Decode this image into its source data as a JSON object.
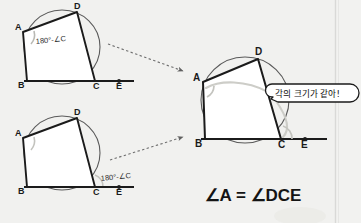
{
  "canvas": {
    "width": 361,
    "height": 223,
    "background": "#f2f2f0",
    "divider_color": "#d8d8d6"
  },
  "colors": {
    "ink": "#1a1a1a",
    "circle": "#555555",
    "quad_fill": "#ffffff",
    "arrow": "#6f6f6f",
    "highlight_arc": "#c9c9c4",
    "bubble_fill": "#ffffff",
    "bubble_stroke": "#1a1a1a",
    "shade": "#cfcfcb"
  },
  "diagrams": [
    {
      "id": "top-left",
      "name": "cyclic-quadrilateral-top-left",
      "vertices": [
        {
          "label": "A",
          "x": 23,
          "y": 32
        },
        {
          "label": "B",
          "x": 27,
          "y": 81
        },
        {
          "label": "C",
          "x": 95,
          "y": 81
        },
        {
          "label": "D",
          "x": 77,
          "y": 12
        },
        {
          "label": "E",
          "x": 119,
          "y": 81
        }
      ],
      "angle_label": "180°-∠C",
      "angle_label_pos": {
        "x": 36,
        "y": 43
      },
      "circle": {
        "cx": 62,
        "cy": 47,
        "r": 38
      },
      "tangent_line": {
        "x1": 24,
        "y1": 81,
        "x2": 134,
        "y2": 81
      }
    },
    {
      "id": "bottom-left",
      "name": "cyclic-quadrilateral-bottom-left",
      "vertices": [
        {
          "label": "A",
          "x": 23,
          "y": 138
        },
        {
          "label": "B",
          "x": 27,
          "y": 187
        },
        {
          "label": "C",
          "x": 95,
          "y": 187
        },
        {
          "label": "D",
          "x": 77,
          "y": 118
        },
        {
          "label": "E",
          "x": 119,
          "y": 187
        }
      ],
      "angle_label": "180°-∠C",
      "angle_label_pos": {
        "x": 101,
        "y": 180
      },
      "circle": {
        "cx": 62,
        "cy": 153,
        "r": 38
      },
      "tangent_line": {
        "x1": 24,
        "y1": 187,
        "x2": 134,
        "y2": 187
      }
    },
    {
      "id": "right",
      "name": "cyclic-quadrilateral-result",
      "vertices": [
        {
          "label": "A",
          "x": 203,
          "y": 82
        },
        {
          "label": "B",
          "x": 205,
          "y": 139
        },
        {
          "label": "C",
          "x": 281,
          "y": 139
        },
        {
          "label": "D",
          "x": 258,
          "y": 59
        },
        {
          "label": "E",
          "x": 305,
          "y": 139
        }
      ],
      "circle": {
        "cx": 245,
        "cy": 100,
        "r": 44
      },
      "tangent_line": {
        "x1": 201,
        "y1": 139,
        "x2": 327,
        "y2": 139
      }
    }
  ],
  "arrows": [
    {
      "name": "arrow-top-to-result",
      "from": {
        "x": 108,
        "y": 44
      },
      "to": {
        "x": 185,
        "y": 72
      }
    },
    {
      "name": "arrow-bottom-to-result",
      "from": {
        "x": 110,
        "y": 159
      },
      "to": {
        "x": 185,
        "y": 137
      }
    }
  ],
  "bubble": {
    "text": "각의 크기가 같아!",
    "x": 268,
    "y": 82,
    "width": 84,
    "height": 20
  },
  "formula": {
    "text": "∠A = ∠DCE",
    "x": 253,
    "y": 199
  }
}
